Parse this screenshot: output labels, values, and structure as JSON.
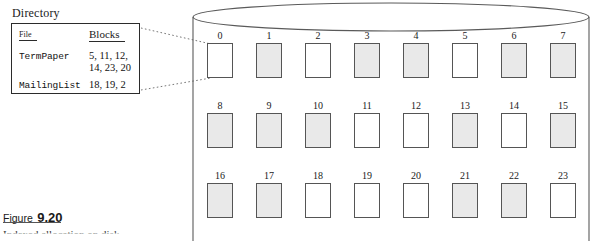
{
  "figure": {
    "caption_word": "Figure",
    "caption_number": "9.20",
    "caption_subtitle": "Indexed allocation on disk"
  },
  "directory": {
    "title": "Directory",
    "columns": {
      "file": "File",
      "blocks": "Blocks"
    },
    "rows": [
      {
        "file": "TermPaper",
        "blocks": "5, 11, 12,\n14, 23, 20"
      },
      {
        "file": "MailingList",
        "blocks": "18, 19, 2"
      }
    ]
  },
  "disk": {
    "rows": 3,
    "columns": 8,
    "blocks": [
      {
        "id": "0",
        "state": "free"
      },
      {
        "id": "1",
        "state": "used"
      },
      {
        "id": "2",
        "state": "free"
      },
      {
        "id": "3",
        "state": "used"
      },
      {
        "id": "4",
        "state": "used"
      },
      {
        "id": "5",
        "state": "free"
      },
      {
        "id": "6",
        "state": "used"
      },
      {
        "id": "7",
        "state": "used"
      },
      {
        "id": "8",
        "state": "used"
      },
      {
        "id": "9",
        "state": "used"
      },
      {
        "id": "10",
        "state": "used"
      },
      {
        "id": "11",
        "state": "free"
      },
      {
        "id": "12",
        "state": "free"
      },
      {
        "id": "13",
        "state": "used"
      },
      {
        "id": "14",
        "state": "free"
      },
      {
        "id": "15",
        "state": "used"
      },
      {
        "id": "16",
        "state": "used"
      },
      {
        "id": "17",
        "state": "used"
      },
      {
        "id": "18",
        "state": "free"
      },
      {
        "id": "19",
        "state": "free"
      },
      {
        "id": "20",
        "state": "free"
      },
      {
        "id": "21",
        "state": "used"
      },
      {
        "id": "22",
        "state": "used"
      },
      {
        "id": "23",
        "state": "free"
      }
    ]
  },
  "colors": {
    "block_used_fill": "#e9e9e9",
    "block_free_fill": "#ffffff",
    "block_stroke": "#555555",
    "outline": "#2b2b2b",
    "background": "#ffffff"
  }
}
